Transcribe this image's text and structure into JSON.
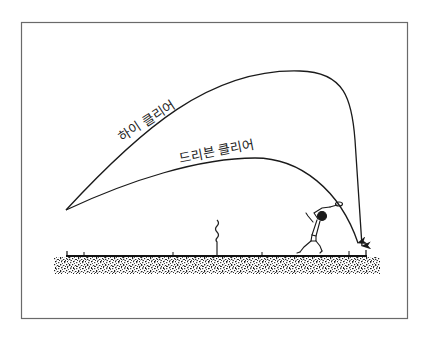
{
  "diagram": {
    "title": "",
    "labels": {
      "high_clear": "하이 클리어",
      "driven_clear": "드리븐 클리어"
    },
    "elements": [
      {
        "name": "high-clear-trajectory",
        "label": "하이 클리어",
        "type": "curve-arrow"
      },
      {
        "name": "driven-clear-trajectory",
        "label": "드리븐 클리어",
        "type": "curve-arrow"
      },
      {
        "name": "net",
        "type": "post"
      },
      {
        "name": "player",
        "type": "figure"
      },
      {
        "name": "court-floor",
        "type": "ground"
      }
    ],
    "colors": {
      "line": "#1a1a1a",
      "frame": "#555555",
      "background": "#ffffff"
    }
  }
}
